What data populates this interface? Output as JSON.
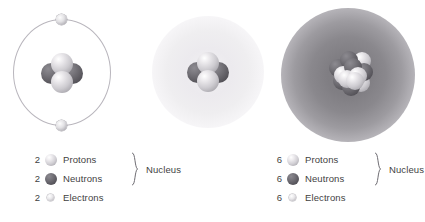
{
  "diagram": {
    "background_color": "#ffffff",
    "colors": {
      "proton": "#cdcbd0",
      "neutron": "#5f5d63",
      "electron": "#d9d7dc",
      "orbit_line": "#b9b6bd",
      "cloud_helium": "#efeef0",
      "cloud_carbon": "#807e83",
      "text": "#3f3f3f"
    }
  },
  "models": [
    {
      "id": "helium-bohr",
      "element": "Helium",
      "style": "bohr-orbit",
      "orbit_electrons": 2,
      "nucleus": {
        "protons": 2,
        "neutrons": 2
      }
    },
    {
      "id": "helium-cloud",
      "element": "Helium",
      "style": "electron-cloud",
      "nucleus": {
        "protons": 2,
        "neutrons": 2
      }
    },
    {
      "id": "carbon-cloud",
      "element": "Carbon",
      "style": "electron-cloud",
      "nucleus": {
        "protons": 6,
        "neutrons": 6
      }
    }
  ],
  "legends": [
    {
      "id": "legend-helium",
      "nucleus_caption": "Nucleus",
      "rows": [
        {
          "count": "2",
          "label": "Protons",
          "particle": "proton"
        },
        {
          "count": "2",
          "label": "Neutrons",
          "particle": "neutron"
        },
        {
          "count": "2",
          "label": "Electrons",
          "particle": "electron"
        }
      ]
    },
    {
      "id": "legend-carbon",
      "nucleus_caption": "Nucleus",
      "rows": [
        {
          "count": "6",
          "label": "Protons",
          "particle": "proton"
        },
        {
          "count": "6",
          "label": "Neutrons",
          "particle": "neutron"
        },
        {
          "count": "6",
          "label": "Electrons",
          "particle": "electron"
        }
      ]
    }
  ]
}
